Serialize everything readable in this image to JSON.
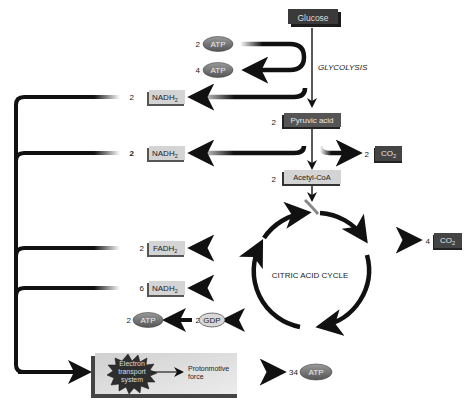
{
  "nodes": {
    "glucose": {
      "label": "Glucose"
    },
    "glycolysis": {
      "label": "GLYCOLYSIS"
    },
    "atp_in": {
      "count": "2",
      "label": "ATP"
    },
    "atp_out": {
      "count": "4",
      "label": "ATP"
    },
    "nadh_glycolysis": {
      "count": "2",
      "label": "NADH",
      "sub": "2"
    },
    "pyruvic": {
      "count": "2",
      "label": "Pyruvic acid"
    },
    "nadh_pyruvate": {
      "count": "2",
      "label": "NADH",
      "sub": "2"
    },
    "co2_pyruvate": {
      "count": "2",
      "label": "CO",
      "sub": "2"
    },
    "acetyl": {
      "count": "2",
      "label": "Acetyl-CoA"
    },
    "cycle": {
      "label": "CITRIC ACID CYCLE"
    },
    "co2_cycle": {
      "count": "4",
      "label": "CO",
      "sub": "2"
    },
    "fadh": {
      "count": "2",
      "label": "FADH",
      "sub": "2"
    },
    "nadh_cycle": {
      "count": "6",
      "label": "NADH",
      "sub": "2"
    },
    "atp_cycle": {
      "count": "2",
      "label": "ATP"
    },
    "gdp": {
      "count": "2",
      "label": "GDP"
    },
    "ets": {
      "line1": "Electron",
      "line2": "transport",
      "line3": "system"
    },
    "pmf": {
      "line1": "Protonmotive",
      "line2": "force"
    },
    "atp_final": {
      "count": "34",
      "label": "ATP"
    }
  },
  "colors": {
    "dark_box": "#3a3a3a",
    "light_box": "#d4d4d4",
    "ellipse": "#6a6a6a",
    "arrow": "#111111",
    "ets_panel": "#e2e2e2"
  }
}
